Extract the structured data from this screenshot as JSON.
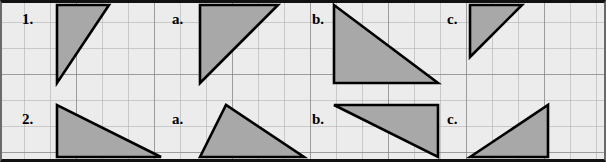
{
  "worksheet": {
    "title": "Triangle area grid worksheet",
    "grid": {
      "cell_px": 26,
      "cols": 23,
      "rows": 6,
      "major_every": 3,
      "bg_color": "#ececec",
      "minor_line_color": "#a5a5a5",
      "major_line_color": "#787878",
      "border_color": "#111111"
    },
    "shape_style": {
      "fill": "#a8a8a8",
      "stroke": "#000000",
      "stroke_width": 2.6
    },
    "labels": [
      {
        "id": "label-1",
        "text": "1.",
        "x": 22,
        "y": 12
      },
      {
        "id": "label-1a",
        "text": "a.",
        "x": 172,
        "y": 12
      },
      {
        "id": "label-1b",
        "text": "b.",
        "x": 312,
        "y": 12
      },
      {
        "id": "label-1c",
        "text": "c.",
        "x": 447,
        "y": 12
      },
      {
        "id": "label-2",
        "text": "2.",
        "x": 22,
        "y": 112
      },
      {
        "id": "label-2a",
        "text": "a.",
        "x": 172,
        "y": 112
      },
      {
        "id": "label-2b",
        "text": "b.",
        "x": 312,
        "y": 112
      },
      {
        "id": "label-2c",
        "text": "c.",
        "x": 447,
        "y": 112
      }
    ],
    "shapes": [
      {
        "id": "triangle-1",
        "name": "triangle-1",
        "label": "1.",
        "kind": "right-triangle",
        "base_cells": 2,
        "height_cells": 3,
        "points": "57,5 109,5 57,83"
      },
      {
        "id": "triangle-1a",
        "name": "triangle-1a",
        "label": "a.",
        "kind": "right-triangle",
        "base_cells": 3,
        "height_cells": 3,
        "points": "200,5 278,5 200,83"
      },
      {
        "id": "triangle-1b",
        "name": "triangle-1b",
        "label": "b.",
        "kind": "right-triangle",
        "base_cells": 4,
        "height_cells": 3,
        "points": "334,5 334,83 438,83"
      },
      {
        "id": "triangle-1c",
        "name": "triangle-1c",
        "label": "c.",
        "kind": "right-triangle",
        "base_cells": 2,
        "height_cells": 2,
        "points": "470,5 522,5 470,57"
      },
      {
        "id": "triangle-2",
        "name": "triangle-2",
        "label": "2.",
        "kind": "right-triangle",
        "base_cells": 4,
        "height_cells": 2,
        "points": "57,105 57,157 161,157"
      },
      {
        "id": "triangle-2a",
        "name": "triangle-2a",
        "label": "a.",
        "kind": "acute-triangle",
        "base_cells": 4,
        "height_cells": 2,
        "points": "200,157 226,105 304,157"
      },
      {
        "id": "triangle-2b",
        "name": "triangle-2b",
        "label": "b.",
        "kind": "right-triangle",
        "base_cells": 4,
        "height_cells": 2,
        "points": "334,105 438,105 438,157"
      },
      {
        "id": "triangle-2c",
        "name": "triangle-2c",
        "label": "c.",
        "kind": "right-triangle",
        "base_cells": 3,
        "height_cells": 2,
        "points": "470,157 548,105 548,157"
      }
    ]
  }
}
